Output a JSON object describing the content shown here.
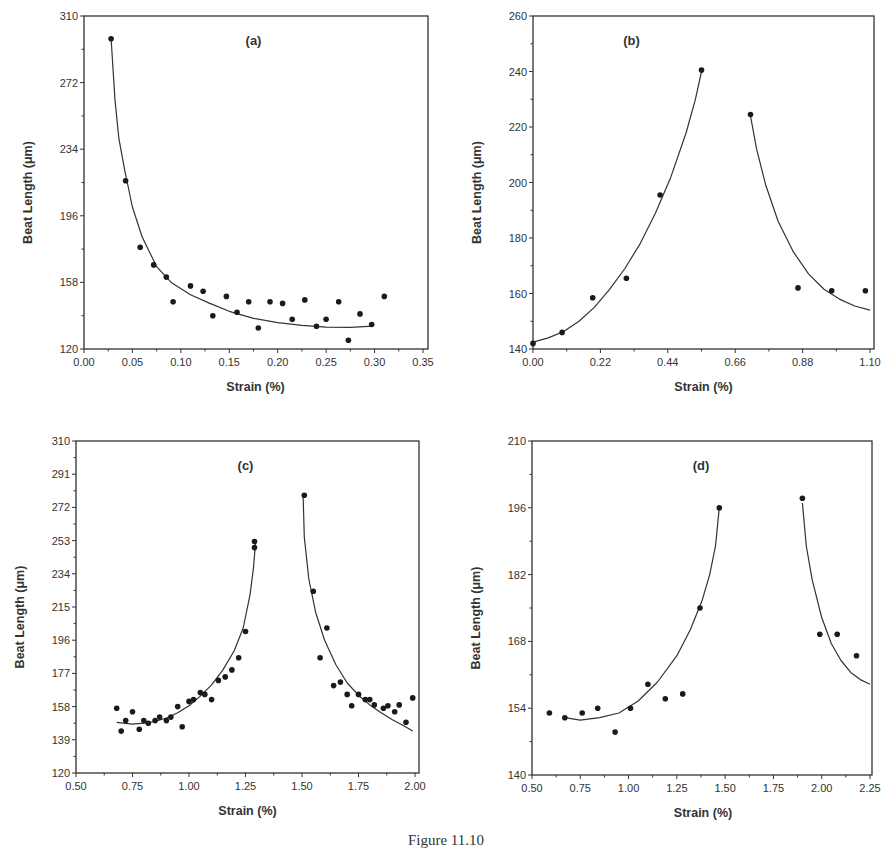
{
  "caption": "Figure 11.10",
  "chart_data": [
    {
      "id": "a",
      "type": "scatter",
      "panel_label": "(a)",
      "xlabel": "Strain (%)",
      "ylabel": "Beat Length (μm)",
      "xlim": [
        0.0,
        0.35
      ],
      "ylim": [
        120,
        310
      ],
      "xticks": [
        "0.00",
        "0.05",
        "0.10",
        "0.15",
        "0.20",
        "0.25",
        "0.30",
        "0.35"
      ],
      "yticks": [
        "120",
        "158",
        "196",
        "234",
        "272",
        "310"
      ],
      "grid": false,
      "frame": {
        "x0": 84,
        "x1": 423,
        "yt": 16,
        "yb": 349,
        "right": 428
      },
      "points": [
        [
          0.028,
          297
        ],
        [
          0.043,
          216
        ],
        [
          0.058,
          178
        ],
        [
          0.072,
          168
        ],
        [
          0.085,
          161
        ],
        [
          0.092,
          147
        ],
        [
          0.11,
          156
        ],
        [
          0.123,
          153
        ],
        [
          0.133,
          139
        ],
        [
          0.147,
          150
        ],
        [
          0.158,
          141
        ],
        [
          0.17,
          147
        ],
        [
          0.18,
          132
        ],
        [
          0.192,
          147
        ],
        [
          0.205,
          146
        ],
        [
          0.215,
          137
        ],
        [
          0.228,
          148
        ],
        [
          0.24,
          133
        ],
        [
          0.25,
          137
        ],
        [
          0.263,
          147
        ],
        [
          0.273,
          125
        ],
        [
          0.285,
          140
        ],
        [
          0.297,
          134
        ],
        [
          0.31,
          150
        ]
      ],
      "fit_curves": [
        [
          [
            0.028,
            297
          ],
          [
            0.032,
            262
          ],
          [
            0.036,
            240
          ],
          [
            0.042,
            222
          ],
          [
            0.05,
            201
          ],
          [
            0.06,
            184
          ],
          [
            0.075,
            167
          ],
          [
            0.09,
            158
          ],
          [
            0.11,
            151
          ],
          [
            0.13,
            146
          ],
          [
            0.15,
            141.5
          ],
          [
            0.175,
            137.5
          ],
          [
            0.2,
            135
          ],
          [
            0.225,
            133.5
          ],
          [
            0.25,
            132.5
          ],
          [
            0.275,
            132.3
          ],
          [
            0.298,
            133
          ]
        ]
      ]
    },
    {
      "id": "b",
      "type": "scatter",
      "panel_label": "(b)",
      "xlabel": "Strain (%)",
      "ylabel": "Beat Length (μm)",
      "xlim": [
        0.0,
        1.1
      ],
      "ylim": [
        140,
        260
      ],
      "xticks": [
        "0.00",
        "0.22",
        "0.44",
        "0.66",
        "0.88",
        "1.10"
      ],
      "yticks": [
        "140",
        "160",
        "180",
        "200",
        "220",
        "240",
        "260"
      ],
      "grid": false,
      "frame": {
        "x0": 533,
        "x1": 870,
        "yt": 16,
        "yb": 349,
        "right": 874
      },
      "points": [
        [
          0.0,
          142
        ],
        [
          0.095,
          146
        ],
        [
          0.195,
          158.5
        ],
        [
          0.305,
          165.5
        ],
        [
          0.415,
          195.5
        ],
        [
          0.55,
          240.5
        ],
        [
          0.71,
          224.5
        ],
        [
          0.865,
          162
        ],
        [
          0.975,
          161
        ],
        [
          1.085,
          161
        ]
      ],
      "fit_curves": [
        [
          [
            0.0,
            142.5
          ],
          [
            0.05,
            144
          ],
          [
            0.1,
            146.3
          ],
          [
            0.15,
            150
          ],
          [
            0.2,
            155
          ],
          [
            0.25,
            161.5
          ],
          [
            0.3,
            169
          ],
          [
            0.35,
            178
          ],
          [
            0.4,
            189
          ],
          [
            0.45,
            202
          ],
          [
            0.5,
            218
          ],
          [
            0.53,
            230
          ],
          [
            0.55,
            240
          ]
        ],
        [
          [
            0.71,
            224
          ],
          [
            0.73,
            212
          ],
          [
            0.76,
            199
          ],
          [
            0.8,
            186
          ],
          [
            0.85,
            175
          ],
          [
            0.9,
            167
          ],
          [
            0.95,
            161.5
          ],
          [
            1.0,
            158
          ],
          [
            1.05,
            155.5
          ],
          [
            1.1,
            154
          ]
        ]
      ]
    },
    {
      "id": "c",
      "type": "scatter",
      "panel_label": "(c)",
      "xlabel": "Strain (%)",
      "ylabel": "Beat Length (μm)",
      "xlim": [
        0.5,
        2.0
      ],
      "ylim": [
        120,
        310
      ],
      "xticks": [
        "0.50",
        "0.75",
        "1.00",
        "1.25",
        "1.50",
        "1.75",
        "2.00"
      ],
      "yticks": [
        "120",
        "139",
        "158",
        "177",
        "196",
        "215",
        "234",
        "253",
        "272",
        "291",
        "310"
      ],
      "grid": false,
      "frame": {
        "x0": 76,
        "x1": 415,
        "yt": 441,
        "yb": 773,
        "right": 419
      },
      "points": [
        [
          0.68,
          157
        ],
        [
          0.7,
          144
        ],
        [
          0.72,
          150
        ],
        [
          0.75,
          155
        ],
        [
          0.78,
          145
        ],
        [
          0.8,
          150
        ],
        [
          0.82,
          148.5
        ],
        [
          0.85,
          150
        ],
        [
          0.87,
          152
        ],
        [
          0.9,
          150
        ],
        [
          0.92,
          152
        ],
        [
          0.95,
          158
        ],
        [
          0.97,
          146.5
        ],
        [
          1.0,
          161
        ],
        [
          1.02,
          162
        ],
        [
          1.05,
          166
        ],
        [
          1.07,
          165
        ],
        [
          1.1,
          162
        ],
        [
          1.13,
          173
        ],
        [
          1.16,
          175
        ],
        [
          1.19,
          179
        ],
        [
          1.22,
          186
        ],
        [
          1.25,
          201
        ],
        [
          1.29,
          252.5
        ],
        [
          1.29,
          249
        ],
        [
          1.51,
          279
        ],
        [
          1.55,
          224
        ],
        [
          1.58,
          186
        ],
        [
          1.61,
          203
        ],
        [
          1.64,
          170
        ],
        [
          1.67,
          172
        ],
        [
          1.7,
          165
        ],
        [
          1.72,
          158.5
        ],
        [
          1.75,
          165
        ],
        [
          1.78,
          162
        ],
        [
          1.8,
          162
        ],
        [
          1.82,
          159
        ],
        [
          1.86,
          157
        ],
        [
          1.88,
          158.5
        ],
        [
          1.91,
          155
        ],
        [
          1.93,
          159
        ],
        [
          1.96,
          149
        ],
        [
          1.99,
          163
        ]
      ],
      "fit_curves": [
        [
          [
            0.68,
            149
          ],
          [
            0.75,
            148
          ],
          [
            0.8,
            148.5
          ],
          [
            0.85,
            149.5
          ],
          [
            0.9,
            151.5
          ],
          [
            0.95,
            154.5
          ],
          [
            1.0,
            158.5
          ],
          [
            1.05,
            164
          ],
          [
            1.1,
            170.5
          ],
          [
            1.15,
            179
          ],
          [
            1.2,
            190
          ],
          [
            1.24,
            203
          ],
          [
            1.27,
            222
          ],
          [
            1.285,
            237
          ],
          [
            1.295,
            253
          ]
        ],
        [
          [
            1.505,
            279
          ],
          [
            1.51,
            255
          ],
          [
            1.53,
            231
          ],
          [
            1.56,
            212
          ],
          [
            1.6,
            196
          ],
          [
            1.65,
            182
          ],
          [
            1.7,
            171.5
          ],
          [
            1.75,
            164.5
          ],
          [
            1.8,
            159
          ],
          [
            1.85,
            154.5
          ],
          [
            1.9,
            150.5
          ],
          [
            1.95,
            147
          ],
          [
            1.99,
            144
          ]
        ]
      ]
    },
    {
      "id": "d",
      "type": "scatter",
      "panel_label": "(d)",
      "xlabel": "Strain (%)",
      "ylabel": "Beat Length (μm)",
      "xlim": [
        0.5,
        2.25
      ],
      "ylim": [
        140,
        210
      ],
      "xticks": [
        "0.50",
        "0.75",
        "1.00",
        "1.25",
        "1.50",
        "1.75",
        "2.00",
        "2.25"
      ],
      "yticks": [
        "140",
        "154",
        "168",
        "182",
        "196",
        "210"
      ],
      "grid": false,
      "frame": {
        "x0": 532,
        "x1": 870,
        "yt": 441,
        "yb": 775,
        "right": 872
      },
      "points": [
        [
          0.59,
          153
        ],
        [
          0.67,
          152
        ],
        [
          0.76,
          153
        ],
        [
          0.84,
          154
        ],
        [
          0.93,
          149
        ],
        [
          1.01,
          154
        ],
        [
          1.1,
          159
        ],
        [
          1.19,
          156
        ],
        [
          1.28,
          157
        ],
        [
          1.37,
          175
        ],
        [
          1.47,
          196
        ],
        [
          1.9,
          198
        ],
        [
          1.99,
          169.5
        ],
        [
          2.08,
          169.5
        ],
        [
          2.18,
          165
        ]
      ],
      "fit_curves": [
        [
          [
            0.67,
            152
          ],
          [
            0.75,
            151.5
          ],
          [
            0.85,
            152
          ],
          [
            0.95,
            153
          ],
          [
            1.05,
            155.5
          ],
          [
            1.15,
            159.5
          ],
          [
            1.25,
            165
          ],
          [
            1.32,
            170.5
          ],
          [
            1.38,
            176.5
          ],
          [
            1.42,
            182
          ],
          [
            1.45,
            188
          ],
          [
            1.47,
            196
          ]
        ],
        [
          [
            1.9,
            197
          ],
          [
            1.92,
            188
          ],
          [
            1.95,
            181
          ],
          [
            2.0,
            173
          ],
          [
            2.05,
            167.5
          ],
          [
            2.1,
            164
          ],
          [
            2.15,
            161.5
          ],
          [
            2.2,
            160
          ],
          [
            2.25,
            159
          ]
        ]
      ]
    }
  ]
}
